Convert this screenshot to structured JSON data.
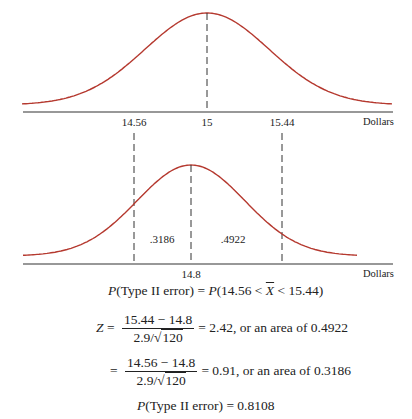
{
  "chart_data": [
    {
      "type": "line",
      "title": "Sampling distribution under H0",
      "description": "Normal curve centered at 15 with critical values 14.56 and 15.44",
      "xlabel": "Dollars",
      "mean": 15,
      "tick_labels": [
        "14.56",
        "15",
        "15.44"
      ],
      "x_range": [
        14.1,
        15.9
      ],
      "dashed_lines": [
        15
      ]
    },
    {
      "type": "area",
      "title": "Sampling distribution under true mean 14.8",
      "xlabel": "Dollars",
      "mean": 14.8,
      "tick_labels": [
        "14.8"
      ],
      "dashed_lines": [
        14.56,
        14.8,
        15.44
      ],
      "region_labels": [
        {
          "label": ".3186",
          "from": 14.56,
          "to": 14.8
        },
        {
          "label": ".4922",
          "from": 14.8,
          "to": 15.44
        }
      ]
    }
  ],
  "top_chart": {
    "ticks": [
      {
        "label": "14.56",
        "x": 134
      },
      {
        "label": "15",
        "x": 207
      },
      {
        "label": "15.44",
        "x": 282
      }
    ],
    "axis_label": "Dollars"
  },
  "bottom_chart": {
    "ticks": [
      {
        "label": "14.8",
        "x": 191
      }
    ],
    "regions": [
      {
        "label": ".3186",
        "x": 162
      },
      {
        "label": ".4922",
        "x": 233
      }
    ],
    "axis_label": "Dollars"
  },
  "equations": {
    "line1": {
      "lhs_p": "P",
      "lhs_rest": "(Type II error) = ",
      "rhs_p": "P",
      "rhs_open": "(14.56 < ",
      "xbar": "X",
      "rhs_close": " < 15.44)"
    },
    "line2": {
      "z": "Z",
      "eq": " = ",
      "num": "15.44 − 14.8",
      "den_a": "2.9/",
      "den_root": "120",
      "rest": "= 2.42, or an area of 0.4922"
    },
    "line3": {
      "eq": "= ",
      "num": "14.56 − 14.8",
      "den_a": "2.9/",
      "den_root": "120",
      "rest": "= 0.91, or an area of 0.3186"
    },
    "line4": {
      "p": "P",
      "rest": "(Type II error) = 0.8108"
    }
  },
  "colors": {
    "curve": "#b5392f",
    "axis": "#333333"
  }
}
